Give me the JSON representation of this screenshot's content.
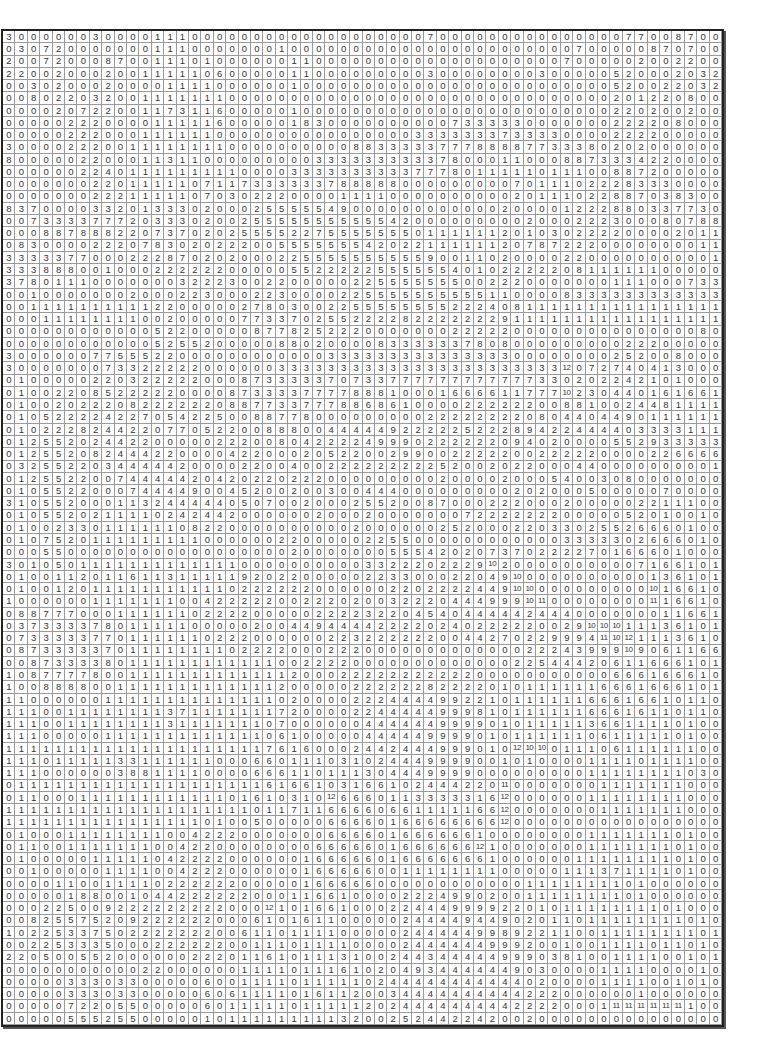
{
  "grid": {
    "columns": 58,
    "rows": [
      "3 0 0 0 0 0 0 3 0 0 0 0 1 1 1 0 0 0 0 0 0 0 0 0 0 0 0 0 0 0 0 0 0 0 7 0 0 0 0 0 0 0 0 0 0 0 0 0 0 0 7 7 0 0 8 7 0 0",
      "0 3 0 7 2 0 0 0 0 0 0 0 1 1 1 0 0 0 0 0 0 0 1 0 0 0 0 0 0 0 0 0 0 0 0 0 0 0 0 0 0 0 0 0 0 0 7 0 0 0 0 0 8 7 0 7 0 0",
      "2 0 0 7 2 0 0 0 8 7 0 0 1 1 1 0 1 0 0 0 0 0 0 1 1 0 0 0 0 0 0 0 0 0 0 0 0 0 0 0 0 0 0 0 0 7 0 0 0 0 0 2 0 0 2 2 0 0",
      "2 2 0 0 2 0 0 0 2 0 0 1 1 1 1 1 0 6 0 0 0 0 0 1 1 0 0 0 0 0 0 0 0 0 3 0 0 0 0 0 0 0 0 3 0 0 0 0 0 5 2 0 0 0 2 0 3 2",
      "0 0 3 0 2 0 0 0 2 0 0 0 0 1 1 1 1 0 0 0 0 0 0 1 0 0 0 0 0 0 0 0 0 0 0 0 0 0 0 0 0 0 0 0 0 0 0 0 0 5 2 0 0 2 2 0 3 2",
      "0 0 8 0 2 2 0 3 2 0 0 1 1 1 1 1 1 1 0 0 0 0 0 0 0 0 0 0 0 0 0 0 0 0 0 0 0 0 0 0 0 0 0 0 0 0 0 0 0 2 0 1 2 2 0 8 0 0",
      "0 0 0 0 2 0 7 2 2 0 0 1 1 7 3 1 1 6 0 0 0 0 0 1 0 0 0 0 0 0 0 0 0 0 0 0 0 0 0 0 0 0 0 0 0 0 0 0 0 2 2 0 2 0 0 2 0 0",
      "0 0 0 0 0 2 2 2 0 0 0 0 1 1 1 1 1 6 0 0 0 0 0 1 8 3 0 0 0 0 0 0 0 0 0 0 7 3 3 3 3 3 0 0 0 0 0 0 0 2 2 2 2 0 8 0 0 0",
      "0 0 0 0 0 2 2 2 0 0 0 1 1 1 1 1 1 0 0 0 0 0 0 0 0 0 0 0 0 0 0 0 0 3 3 3 3 3 3 3 7 3 3 3 3 0 0 0 0 2 2 2 2 0 0 0 0 0",
      "3 0 0 0 0 2 2 2 0 0 1 1 1 1 1 1 1 1 0 0 0 0 0 0 0 0 0 0 8 8 3 3 3 3 3 7 7 7 8 8 8 8 7 7 3 3 3 8 0 2 0 2 0 0 0 0 0 0",
      "8 0 0 0 0 0 2 2 0 0 0 1 1 3 1 1 0 0 0 0 0 0 0 0 0 3 3 3 3 3 3 3 3 3 3 7 8 0 0 0 1 1 0 0 0 8 8 7 3 3 3 4 2 2 0 0 0 0",
      "0 0 0 0 0 0 2 2 4 0 1 1 1 1 1 1 1 1 1 0 0 0 0 3 3 3 3 3 3 3 3 3 3 7 7 7 8 0 1 1 1 1 1 0 1 1 1 0 0 8 8 7 2 0 0 0 0 0",
      "0 0 0 0 0 0 0 2 2 0 1 1 1 1 1 0 7 1 1 7 3 3 3 3 3 3 7 8 8 8 8 8 0 0 0 0 0 0 0 0 0 7 0 1 1 1 0 2 2 2 8 3 3 3 0 0 0 0",
      "0 0 0 0 0 0 0 2 2 2 1 1 1 1 1 0 7 0 3 0 2 2 2 0 0 0 0 1 1 1 1 0 0 0 0 0 0 0 0 0 0 2 0 1 1 1 0 2 2 8 8 7 0 3 8 3 0 0",
      "8 3 7 0 0 0 0 3 3 2 0 1 3 3 3 0 2 0 0 0 2 5 5 5 5 5 4 9 0 0 0 0 0 0 0 0 0 0 0 0 2 0 0 0 0 1 2 2 2 8 8 0 3 3 7 7 3 0",
      "0 0 7 3 3 3 3 7 7 7 2 0 3 3 3 0 2 0 0 2 5 5 5 5 5 5 5 5 5 5 5 4 2 0 0 0 0 0 0 0 0 0 2 0 0 0 2 2 2 3 0 0 0 8 0 7 8 8",
      "0 0 0 8 8 7 8 8 8 2 2 0 7 3 7 0 2 0 2 5 5 5 5 2 2 7 5 5 5 5 5 5 5 0 1 1 1 1 1 1 2 0 1 0 3 0 2 2 2 2 0 0 0 0 2 0 1 1",
      "0 8 3 0 0 0 0 2 2 2 0 7 8 3 0 2 0 2 2 2 0 0 5 5 5 5 5 5 5 4 2 0 2 2 1 1 1 1 1 1 2 0 7 8 7 2 2 2 0 0 0 0 0 0 0 0 1 1",
      "3 3 3 3 3 7 7 0 0 0 2 2 2 8 7 0 2 0 2 0 0 0 2 2 5 5 5 5 5 5 5 5 5 5 9 0 0 1 1 0 2 0 0 0 0 2 2 0 0 0 0 0 0 0 0 0 0 1",
      "3 3 3 8 8 8 0 0 1 0 0 0 2 2 2 2 2 2 0 0 0 0 0 5 5 2 2 2 2 2 5 5 5 5 5 5 4 0 1 0 2 2 2 2 2 0 8 1 1 1 1 1 1 0 0 0 0 0",
      "3 7 8 0 1 1 1 0 0 0 0 0 0 0 3 2 2 2 3 0 0 2 2 0 0 0 0 0 2 2 5 5 5 5 5 5 5 0 0 2 2 2 0 0 0 0 0 0 0 1 1 1 0 0 0 7 3 3",
      "0 0 1 0 0 0 0 0 0 0 2 0 0 0 2 2 3 0 0 0 2 2 3 0 0 0 0 2 2 5 5 5 5 5 5 5 5 5 5 1 1 0 0 0 0 8 3 3 3 3 3 3 3 3 3 3 3 3",
      "0 0 1 1 1 1 1 1 1 1 1 1 2 2 0 0 0 0 0 2 7 8 0 3 0 0 2 2 5 5 5 5 5 5 5 5 2 2 2 4 0 8 1 1 1 1 1 1 1 1 1 1 1 1 1 1 1 1",
      "0 0 0 1 1 1 1 1 1 1 1 0 0 2 0 0 0 0 0 7 7 3 3 7 0 2 5 5 2 2 2 2 8 2 2 2 2 2 2 2 9 1 1 1 1 1 1 1 1 1 1 1 1 1 1 1 1 1",
      "0 0 0 0 0 0 0 0 0 0 0 0 5 2 2 0 0 0 0 0 8 7 7 8 2 5 2 2 2 0 0 0 0 0 0 0 2 2 2 2 2 0 0 0 0 0 0 0 0 0 0 0 0 0 0 0 8 0",
      "0 0 0 0 0 0 0 0 0 0 0 0 5 2 5 5 2 0 0 0 0 0 8 8 0 2 0 0 0 0 8 3 3 3 3 3 3 7 8 0 8 0 0 0 0 0 0 0 0 0 2 2 2 0 0 0 0 0",
      "3 0 0 0 0 0 0 7 7 5 5 5 2 2 0 0 0 0 0 0 0 0 0 0 0 0 3 3 3 3 3 3 3 3 3 3 3 3 3 3 3 0 0 0 0 0 0 0 0 2 5 2 0 0 8 0 0 0",
      "3 0 0 0 0 0 0 0 7 3 3 2 2 2 2 2 0 0 0 0 0 0 3 3 3 3 3 3 3 3 3 3 3 3 3 3 3 3 3 3 3 3 3 3 3 12 0 7 2 7 4 0 4 1 3 0 0 0",
      "0 1 0 0 0 0 0 2 2 0 3 2 2 2 2 2 0 0 0 8 7 3 3 3 3 3 7 0 7 3 3 7 7 7 7 7 7 7 7 7 7 7 7 3 3 0 2 0 2 2 4 2 1 0 1 0 0 0",
      "0 1 0 0 2 2 0 8 5 2 2 2 2 2 0 0 0 0 8 7 3 3 3 3 7 7 7 7 8 8 8 1 0 0 0 1 6 6 6 6 1 1 7 7 7 10 2 3 0 4 4 0 1 6 1 6 6 1",
      "0 1 0 0 2 0 2 2 2 0 8 2 2 2 2 2 2 0 8 8 7 7 3 3 7 7 7 8 8 6 8 6 1 0 0 0 0 2 2 2 2 2 2 0 0 8 8 1 0 0 2 4 4 8 1 1 1 1",
      "0 1 0 5 2 2 2 2 4 2 2 7 0 5 4 2 2 5 0 0 8 8 7 7 8 0 0 0 0 0 0 0 0 0 2 2 2 2 2 2 2 2 0 8 0 4 4 0 4 4 9 0 1 1 1 1 1 1",
      "0 1 0 2 2 2 8 2 4 4 2 2 0 7 7 0 5 2 2 0 0 8 8 8 0 0 4 4 4 4 4 9 2 2 2 2 2 5 2 2 2 8 9 4 2 2 4 4 4 4 0 3 3 3 3 1 1 1",
      "0 1 2 5 5 2 0 2 4 4 2 2 0 0 0 0 0 2 2 2 0 0 8 0 4 2 2 2 2 4 9 9 9 0 2 2 2 2 2 2 0 9 4 0 2 0 0 0 0 5 5 2 9 3 3 3 3 3",
      "0 1 2 5 5 2 0 8 2 4 4 4 2 2 0 0 0 0 4 2 2 0 0 0 2 0 5 2 2 0 0 2 9 9 0 0 2 2 2 2 2 0 0 2 2 2 2 2 0 0 0 0 2 2 6 6 6 6",
      "0 3 2 5 5 2 2 0 3 4 4 4 4 4 2 0 0 0 0 2 2 0 0 4 0 0 2 2 2 2 2 2 2 2 2 5 2 0 0 2 0 2 2 0 0 0 4 4 0 0 0 0 0 0 0 0 0 1",
      "0 1 2 5 5 2 2 0 0 7 4 4 4 4 4 2 0 4 2 0 2 2 0 2 2 2 0 0 0 0 0 0 0 0 0 2 0 0 0 0 2 0 0 0 5 4 0 0 3 0 8 0 0 0 0 0 0 0",
      "0 1 0 5 5 2 2 0 0 0 7 4 4 4 4 9 0 0 4 5 2 0 0 2 0 0 3 0 0 4 4 4 0 0 0 0 0 0 0 0 0 2 0 2 0 0 0 5 0 0 0 0 0 7 0 0 0 0",
      "3 1 0 5 5 2 0 0 0 1 1 3 2 4 4 4 4 4 0 5 0 7 0 0 2 0 0 0 2 5 5 2 0 0 8 7 0 0 0 2 2 2 0 0 0 2 0 0 0 0 0 2 2 1 1 1 0 0",
      "0 1 0 5 5 2 0 2 1 1 1 1 0 2 4 2 4 4 2 0 0 0 0 0 0 2 0 0 0 2 0 0 0 0 0 0 0 7 2 2 2 2 2 2 2 0 0 0 0 0 5 2 0 1 0 0 1 0",
      "0 1 0 0 2 3 3 0 1 1 1 1 1 1 0 8 2 2 0 0 0 0 0 0 0 0 0 0 2 0 0 0 0 0 0 2 5 2 0 0 0 2 2 0 3 3 0 2 5 5 2 6 6 6 0 1 0 0",
      "0 1 0 7 5 2 0 1 1 1 1 1 1 1 1 1 0 0 0 0 0 0 2 2 0 0 0 0 0 2 2 5 5 0 0 0 0 0 0 0 0 0 0 0 0 3 3 3 3 3 0 2 6 6 6 0 1 0",
      "0 0 0 5 5 0 0 0 0 0 0 0 0 0 0 0 0 0 0 0 0 0 0 2 0 0 0 0 0 0 0 5 5 5 4 2 0 2 0 7 3 7 0 2 2 2 2 7 0 1 6 6 6 0 1 0 0 0",
      "3 0 1 0 5 0 1 1 1 1 1 1 1 1 1 1 1 1 1 0 0 0 0 0 0 0 0 0 0 3 3 2 2 2 0 2 2 2 9 10 2 0 0 0 0 0 0 0 0 0 0 7 1 6 6 1 0 1",
      "0 1 0 0 1 1 2 0 1 1 6 1 1 3 1 1 1 1 1 9 2 0 2 2 0 0 0 0 0 2 2 3 3 0 0 0 2 2 0 4 9 10 0 0 0 0 0 0 0 0 0 0 1 3 6 1 0 1",
      "0 1 0 0 1 2 0 1 1 1 1 1 1 1 1 1 1 1 0 2 2 2 2 2 2 0 0 0 0 0 0 2 2 0 2 2 2 2 4 4 9 10 10 0 0 0 0 0 0 0 0 0 10 1 6 6 1 0",
      "1 0 0 0 0 0 0 1 1 1 1 1 1 1 0 0 4 2 2 2 2 2 0 0 2 2 2 0 2 0 0 3 2 2 2 0 4 4 4 9 9 9 10 11 0 0 0 0 0 0 0 0 11 1 6 6 1 0",
      "0 8 8 7 7 7 0 0 0 1 1 1 1 1 1 0 2 2 2 2 0 0 0 0 0 2 2 2 2 3 2 2 0 4 5 4 0 4 4 4 4 4 2 4 4 4 0 0 0 0 0 0 0 1 1 6 6 1",
      "0 3 7 3 3 3 3 7 8 0 1 1 1 1 1 0 0 0 0 0 2 0 0 4 4 9 4 4 4 4 2 2 2 2 0 2 4 0 2 2 2 2 2 0 0 2 9 10 10 10 1 1 1 3 6 1 0 1",
      "0 7 3 3 3 3 3 7 7 0 1 1 1 1 1 1 0 2 2 2 0 0 0 0 0 0 2 2 3 2 2 2 2 2 2 0 0 4 4 2 7 0 2 2 9 9 9 4 11 10 12 1 1 1 3 6 1 0",
      "0 8 7 3 3 3 3 3 7 0 1 1 1 1 1 1 1 1 0 2 2 2 2 0 0 0 2 2 2 0 0 0 0 0 0 0 0 0 0 0 0 0 2 2 2 4 3 9 9 9 10 9 0 6 1 1 6 6",
      "0 0 8 7 3 3 3 3 8 0 1 1 1 1 1 1 1 1 1 1 1 1 0 0 2 2 2 2 0 0 0 0 0 0 0 0 0 0 0 0 0 2 2 5 4 4 4 2 0 6 1 1 6 6 6 1 0 1",
      "1 0 8 7 7 7 7 8 0 0 1 1 1 1 1 1 1 1 1 1 1 1 1 2 0 0 0 2 2 2 2 2 2 2 2 2 2 2 0 0 0 0 0 0 0 0 0 0 0 6 6 6 1 6 6 6 1 0",
      "1 0 0 8 8 8 8 0 0 1 1 1 1 1 1 1 1 1 1 1 1 1 2 0 0 0 0 0 2 2 2 2 2 2 8 2 2 2 2 0 1 0 1 1 1 1 1 1 6 6 6 1 6 6 6 1 0 1",
      "1 1 0 0 0 0 0 0 1 1 1 1 1 1 1 1 1 1 1 1 1 1 0 2 0 0 0 0 2 2 2 4 4 4 4 9 9 2 2 1 0 1 1 1 1 1 1 6 6 6 1 6 6 1 0 1 1 0",
      "1 1 1 0 0 1 1 1 1 1 1 1 1 3 7 1 1 1 1 1 1 1 7 2 0 0 0 0 2 2 4 4 4 4 4 9 9 9 8 1 0 1 1 1 1 1 1 6 6 6 1 6 1 1 0 1 1 0",
      "1 1 1 0 0 1 1 1 1 1 1 1 1 3 1 1 1 1 1 1 1 0 7 0 0 0 0 0 0 4 4 4 4 4 4 9 9 9 9 0 1 0 1 1 1 1 1 3 6 6 1 1 1 1 0 1 0 0",
      "1 1 1 0 0 0 0 0 1 1 1 1 1 1 1 1 1 1 1 1 1 0 6 1 0 0 0 0 0 4 4 4 4 4 9 9 9 9 0 1 0 1 1 1 1 1 1 0 6 1 1 1 1 1 0 1 0 0",
      "1 1 1 1 1 1 1 1 1 1 1 1 1 1 1 1 1 1 1 1 1 7 6 1 6 0 0 0 2 4 4 2 4 4 4 9 9 9 0 1 0 12 10 10 0 1 1 1 0 6 1 1 1 1 1 1 0 0",
      "1 1 1 0 1 1 1 1 1 3 3 1 1 1 1 1 1 0 0 0 6 6 0 1 1 1 0 3 1 0 2 4 4 4 9 9 9 9 0 0 1 0 1 0 0 0 0 1 1 1 1 0 1 1 1 1 0 0",
      "1 1 1 0 0 0 0 0 0 3 8 8 1 1 1 1 0 0 0 0 6 6 6 1 1 0 1 1 1 3 0 4 4 4 9 9 9 9 0 0 0 0 0 0 0 0 0 1 1 1 1 1 1 1 1 0 3 0",
      "0 1 1 1 1 1 1 1 1 1 1 1 1 1 1 1 1 1 1 1 1 6 1 6 6 1 0 3 1 6 6 1 0 2 4 4 4 2 2 0 11 0 0 0 0 0 0 0 1 1 1 1 1 1 1 0 0 0",
      "0 1 1 0 0 0 1 1 1 1 1 1 1 1 1 1 1 1 0 1 6 1 0 3 1 0 12 6 6 6 0 1 1 3 3 3 3 3 1 6 12 0 0 0 0 0 0 1 1 1 1 1 1 1 1 0 0 0",
      "1 1 1 1 1 1 1 1 1 1 1 1 1 1 1 1 1 1 1 1 0 1 1 7 1 1 6 6 6 6 0 6 6 1 1 1 1 1 6 6 12 0 0 0 0 0 0 0 1 1 1 1 1 1 1 0 0 0",
      "1 1 1 1 1 1 1 1 1 1 1 1 1 1 1 1 0 1 0 0 5 0 0 0 0 0 6 6 6 6 0 1 6 6 6 6 6 6 6 6 12 0 0 0 0 0 0 0 0 0 0 0 0 0 0 0 0 0",
      "0 1 0 0 0 1 1 1 1 1 1 1 1 0 0 4 2 2 2 0 0 0 0 0 0 0 6 6 6 6 0 1 6 6 6 6 6 6 1 0 0 0 0 0 0 0 0 1 1 1 1 1 1 1 0 1 0 0",
      "0 1 1 0 0 1 1 1 1 1 1 1 0 0 4 2 2 0 0 0 0 0 0 0 0 6 6 6 6 6 0 1 6 6 6 6 6 6 12 1 0 0 0 0 0 0 0 1 1 1 1 1 1 1 0 1 0 0",
      "0 1 0 0 0 0 0 1 1 1 1 1 0 4 2 2 2 2 0 0 0 0 0 0 1 6 6 6 6 6 0 1 6 6 6 6 6 6 6 1 0 0 0 0 0 0 1 1 1 1 1 1 1 1 0 1 0 0",
      "0 0 1 0 0 0 0 0 1 1 1 1 0 0 4 2 2 2 0 0 0 0 0 0 1 6 6 6 6 6 0 0 1 1 1 1 1 1 1 1 0 0 0 0 0 1 1 1 3 7 1 1 1 1 0 1 0 0",
      "0 0 0 0 1 1 0 0 1 1 1 1 0 2 2 2 2 2 2 0 0 0 0 0 1 6 6 6 6 6 0 0 0 0 0 0 0 0 0 0 0 0 1 1 1 1 1 1 1 1 0 1 0 0 0 0 0 0",
      "0 0 0 0 0 1 8 8 0 0 1 0 4 4 2 2 2 2 2 2 0 0 0 1 1 6 6 1 0 0 0 0 2 2 2 4 9 9 0 2 0 0 1 1 1 1 1 1 1 1 0 1 0 0 0 0 0 0",
      "0 0 0 2 2 5 0 0 9 2 2 2 2 2 2 2 2 2 0 0 0 12 1 0 1 6 6 1 0 0 0 2 2 4 4 4 9 9 9 9 2 2 0 1 0 1 1 1 1 1 1 1 1 0 1 0 0 0",
      "0 0 8 2 5 5 7 5 2 0 9 2 2 2 2 2 2 0 0 0 6 1 0 1 6 1 1 0 0 0 0 0 2 4 4 4 4 9 4 4 9 0 2 0 1 1 0 1 1 1 1 1 1 1 1 0 1 0",
      "1 0 2 2 5 3 3 7 5 0 2 2 2 2 2 2 2 0 0 6 1 1 0 1 1 1 1 0 0 0 0 0 2 4 4 4 4 4 9 9 8 9 2 2 1 1 0 0 1 1 1 1 1 1 1 1 0 1",
      "0 0 2 2 5 3 3 3 5 0 0 0 2 2 2 2 2 2 0 0 1 1 1 0 1 1 1 1 0 0 0 0 2 4 4 4 4 4 4 9 9 9 2 0 0 1 0 0 1 1 1 1 0 1 1 0 1 0",
      "2 2 0 5 0 0 5 5 2 0 0 0 0 0 0 2 2 2 0 1 1 6 1 0 1 1 1 3 1 0 0 2 4 4 3 4 4 4 4 4 9 9 9 0 3 8 1 0 0 1 1 1 1 0 0 1 0 1",
      "0 0 0 0 0 0 0 0 0 0 0 2 2 0 0 0 0 0 0 1 1 1 1 0 1 1 1 6 1 0 2 0 4 9 3 4 4 4 4 4 4 9 0 3 0 0 0 0 1 1 1 1 0 0 0 0 1 0",
      "0 0 0 0 0 3 3 3 0 3 3 0 0 0 0 0 6 0 0 1 1 1 1 0 1 1 1 1 1 0 2 4 4 4 4 4 4 4 4 4 4 4 0 2 0 0 0 0 1 1 1 1 0 0 1 0 1 0",
      "0 0 0 0 0 3 3 3 0 3 3 0 0 0 0 0 6 0 6 1 1 1 1 0 1 6 1 1 2 0 0 3 4 4 4 4 4 4 4 4 4 4 2 2 2 0 0 0 0 0 0 1 0 0 0 0 0 0",
      "0 0 0 0 0 7 2 2 0 5 5 0 0 0 0 0 6 0 1 1 1 1 1 0 1 1 1 1 1 2 0 2 4 4 4 4 4 4 4 4 4 2 2 2 2 0 0 0 1 11 11 11 11 11 11 1 0 0",
      "0 0 0 0 0 5 5 5 2 5 5 0 0 0 0 0 1 0 1 1 1 1 1 1 1 1 1 3 2 0 0 2 5 2 4 4 2 2 4 2 0 0 2 0 0 0 0 0 0 0 0 0 0 0 0 0 0 0"
    ]
  }
}
